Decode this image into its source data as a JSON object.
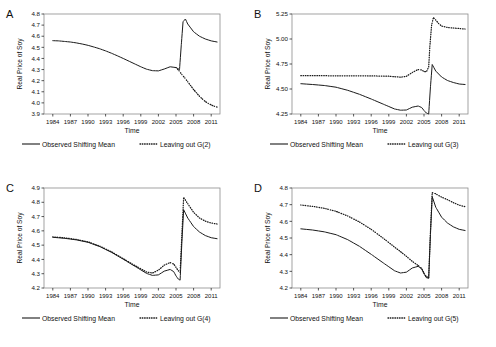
{
  "figure": {
    "ylabel": "Real Price of Soy",
    "xlabel": "Time",
    "legend_observed": "Observed Shifting Mean",
    "line_colors": {
      "observed": "#1a1a1a",
      "leaving_out": "#1a1a1a"
    }
  },
  "chart_data": [
    {
      "type": "line",
      "panel": "A",
      "title": "",
      "xlabel": "Time",
      "ylabel": "Real Price of Soy",
      "xlim": [
        1982.5,
        2012.5
      ],
      "ylim": [
        3.9,
        4.8
      ],
      "yticks": [
        "3.9",
        "4.0",
        "4.1",
        "4.2",
        "4.3",
        "4.4",
        "4.5",
        "4.6",
        "4.7",
        "4.8"
      ],
      "xticks": [
        "1984",
        "1987",
        "1990",
        "1993",
        "1996",
        "1999",
        "2002",
        "2005",
        "2008",
        "2011"
      ],
      "grid": false,
      "legend_position": "below",
      "series": [
        {
          "name": "Observed Shifting Mean",
          "style": "solid",
          "x": [
            1984,
            1985,
            1986,
            1987,
            1988,
            1989,
            1990,
            1991,
            1992,
            1993,
            1994,
            1995,
            1996,
            1997,
            1998,
            1999,
            2000,
            2001,
            2002,
            2003,
            2004,
            2005,
            2005.6,
            2005.9,
            2006.2,
            2006.6,
            2007,
            2008,
            2009,
            2010,
            2011,
            2012
          ],
          "values": [
            4.56,
            4.558,
            4.553,
            4.548,
            4.54,
            4.53,
            4.518,
            4.503,
            4.487,
            4.468,
            4.447,
            4.424,
            4.4,
            4.375,
            4.35,
            4.325,
            4.303,
            4.29,
            4.288,
            4.305,
            4.325,
            4.318,
            4.3,
            4.52,
            4.73,
            4.755,
            4.71,
            4.64,
            4.6,
            4.575,
            4.558,
            4.548
          ]
        },
        {
          "name": "Leaving out G(2)",
          "style": "dotted",
          "x": [
            2005,
            2005.5,
            2006,
            2006.5,
            2007,
            2007.5,
            2008,
            2008.5,
            2009,
            2009.5,
            2010,
            2010.5,
            2011,
            2011.5,
            2012
          ],
          "values": [
            4.318,
            4.29,
            4.255,
            4.225,
            4.19,
            4.155,
            4.12,
            4.09,
            4.06,
            4.035,
            4.012,
            3.995,
            3.982,
            3.97,
            3.962
          ]
        }
      ],
      "legend": [
        "Observed Shifting Mean",
        "Leaving out G(2)"
      ],
      "legend_out_label": "Leaving out G(2)"
    },
    {
      "type": "line",
      "panel": "B",
      "title": "",
      "xlabel": "Time",
      "ylabel": "Real Price of Soy",
      "xlim": [
        1982.5,
        2012.5
      ],
      "ylim": [
        4.25,
        5.25
      ],
      "yticks": [
        "4.25",
        "4.50",
        "4.75",
        "5.00",
        "5.25"
      ],
      "xticks": [
        "1984",
        "1987",
        "1990",
        "1993",
        "1996",
        "1999",
        "2002",
        "2005",
        "2008",
        "2011"
      ],
      "grid": false,
      "legend_position": "below",
      "series": [
        {
          "name": "Observed Shifting Mean",
          "style": "solid",
          "x": [
            1984,
            1986,
            1988,
            1990,
            1992,
            1994,
            1996,
            1998,
            2000,
            2001,
            2002,
            2003,
            2004,
            2004.6,
            2005,
            2005.4,
            2005.8,
            2006.1,
            2006.4,
            2007,
            2008,
            2009,
            2010,
            2011,
            2012
          ],
          "values": [
            4.553,
            4.545,
            4.535,
            4.518,
            4.487,
            4.447,
            4.4,
            4.35,
            4.3,
            4.288,
            4.29,
            4.318,
            4.33,
            4.315,
            4.285,
            4.26,
            4.25,
            4.52,
            4.745,
            4.68,
            4.62,
            4.585,
            4.565,
            4.55,
            4.545
          ]
        },
        {
          "name": "Leaving out G(3)",
          "style": "dotted",
          "x": [
            1984,
            1987,
            1990,
            1993,
            1996,
            1999,
            2000,
            2001,
            2002,
            2003,
            2004,
            2004.6,
            2005,
            2005.4,
            2005.8,
            2006,
            2006.3,
            2006.6,
            2007,
            2007.5,
            2008,
            2009,
            2010,
            2011,
            2012
          ],
          "values": [
            4.633,
            4.633,
            4.632,
            4.632,
            4.631,
            4.628,
            4.623,
            4.618,
            4.627,
            4.665,
            4.695,
            4.69,
            4.675,
            4.672,
            4.72,
            4.93,
            5.14,
            5.215,
            5.19,
            5.155,
            5.13,
            5.115,
            5.11,
            5.105,
            5.1
          ]
        }
      ],
      "legend": [
        "Observed Shifting Mean",
        "Leaving out G(3)"
      ],
      "legend_out_label": "Leaving out G(3)"
    },
    {
      "type": "line",
      "panel": "C",
      "title": "",
      "xlabel": "Time",
      "ylabel": "Real Price of Soy",
      "xlim": [
        1982.5,
        2012.5
      ],
      "ylim": [
        4.2,
        4.9
      ],
      "yticks": [
        "4.2",
        "4.3",
        "4.4",
        "4.5",
        "4.6",
        "4.7",
        "4.8",
        "4.9"
      ],
      "xticks": [
        "1984",
        "1987",
        "1990",
        "1993",
        "1996",
        "1999",
        "2002",
        "2005",
        "2008",
        "2011"
      ],
      "grid": false,
      "legend_position": "below",
      "series": [
        {
          "name": "Observed Shifting Mean",
          "style": "solid",
          "x": [
            1984,
            1986,
            1988,
            1990,
            1992,
            1994,
            1996,
            1998,
            2000,
            2001,
            2002,
            2003,
            2004,
            2004.6,
            2005,
            2005.4,
            2005.7,
            2006,
            2006.3,
            2007,
            2008,
            2009,
            2010,
            2011,
            2012
          ],
          "values": [
            4.555,
            4.548,
            4.537,
            4.52,
            4.49,
            4.45,
            4.402,
            4.352,
            4.302,
            4.288,
            4.292,
            4.318,
            4.33,
            4.315,
            4.285,
            4.262,
            4.255,
            4.52,
            4.748,
            4.69,
            4.63,
            4.592,
            4.567,
            4.552,
            4.545
          ]
        },
        {
          "name": "Leaving out G(4)",
          "style": "dotted",
          "x": [
            1984,
            1986,
            1988,
            1990,
            1992,
            1994,
            1996,
            1998,
            2000,
            2001,
            2002,
            2003,
            2004,
            2004.6,
            2005,
            2005.4,
            2005.7,
            2006,
            2006.3,
            2007,
            2008,
            2009,
            2010,
            2011,
            2012
          ],
          "values": [
            4.558,
            4.551,
            4.54,
            4.523,
            4.493,
            4.453,
            4.405,
            4.357,
            4.312,
            4.305,
            4.325,
            4.36,
            4.378,
            4.368,
            4.345,
            4.32,
            4.31,
            4.57,
            4.835,
            4.79,
            4.73,
            4.69,
            4.668,
            4.655,
            4.648
          ]
        }
      ],
      "legend": [
        "Observed Shifting Mean",
        "Leaving out G(4)"
      ],
      "legend_out_label": "Leaving out G(4)"
    },
    {
      "type": "line",
      "panel": "D",
      "title": "",
      "xlabel": "Time",
      "ylabel": "Real Price of Soy",
      "xlim": [
        1982.5,
        2012.5
      ],
      "ylim": [
        4.2,
        4.8
      ],
      "yticks": [
        "4.2",
        "4.3",
        "4.4",
        "4.5",
        "4.6",
        "4.7",
        "4.8"
      ],
      "xticks": [
        "1984",
        "1987",
        "1990",
        "1993",
        "1996",
        "1999",
        "2002",
        "2005",
        "2008",
        "2011"
      ],
      "grid": false,
      "legend_position": "below",
      "series": [
        {
          "name": "Observed Shifting Mean",
          "style": "solid",
          "x": [
            1984,
            1986,
            1988,
            1990,
            1992,
            1994,
            1996,
            1998,
            2000,
            2001,
            2002,
            2003,
            2004,
            2004.6,
            2005,
            2005.4,
            2005.8,
            2006.1,
            2006.4,
            2007,
            2008,
            2009,
            2010,
            2011,
            2012
          ],
          "values": [
            4.555,
            4.548,
            4.537,
            4.52,
            4.49,
            4.45,
            4.402,
            4.352,
            4.303,
            4.29,
            4.295,
            4.32,
            4.33,
            4.315,
            4.285,
            4.262,
            4.258,
            4.52,
            4.748,
            4.685,
            4.625,
            4.59,
            4.567,
            4.552,
            4.545
          ]
        },
        {
          "name": "Leaving out G(5)",
          "style": "dotted",
          "x": [
            1984,
            1986,
            1988,
            1990,
            1992,
            1994,
            1996,
            1998,
            2000,
            2001,
            2002,
            2003,
            2004,
            2004.6,
            2005,
            2005.4,
            2005.8,
            2006.1,
            2006.4,
            2007,
            2008,
            2009,
            2010,
            2011,
            2012
          ],
          "values": [
            4.698,
            4.69,
            4.678,
            4.66,
            4.632,
            4.596,
            4.552,
            4.5,
            4.445,
            4.418,
            4.39,
            4.36,
            4.335,
            4.318,
            4.29,
            4.268,
            4.262,
            4.54,
            4.772,
            4.765,
            4.745,
            4.73,
            4.712,
            4.697,
            4.688
          ]
        }
      ],
      "legend": [
        "Observed Shifting Mean",
        "Leaving out G(5)"
      ],
      "legend_out_label": "Leaving out G(5)"
    }
  ]
}
